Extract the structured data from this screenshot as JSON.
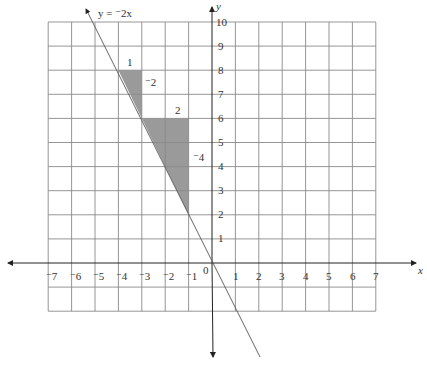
{
  "diagram": {
    "type": "coordinate-plane",
    "equation_label": "y = ⁻2x",
    "axis_labels": {
      "x": "x",
      "y": "y"
    },
    "x_ticks": [
      "⁻7",
      "⁻6",
      "⁻5",
      "⁻4",
      "⁻3",
      "⁻2",
      "⁻1",
      "1",
      "2",
      "3",
      "4",
      "5",
      "6",
      "7"
    ],
    "y_ticks": [
      "1",
      "2",
      "3",
      "4",
      "5",
      "6",
      "7",
      "8",
      "9",
      "10"
    ],
    "origin_label": "0",
    "x_range": [
      -7,
      7
    ],
    "y_range": [
      -2,
      10
    ],
    "line": {
      "slope": -2,
      "intercept": 0
    },
    "slope_triangles": [
      {
        "vertices": [
          [
            -4,
            8
          ],
          [
            -3,
            8
          ],
          [
            -3,
            6
          ]
        ],
        "run_label": "1",
        "rise_label": "⁻2"
      },
      {
        "vertices": [
          [
            -3,
            6
          ],
          [
            -1,
            6
          ],
          [
            -1,
            2
          ]
        ],
        "run_label": "2",
        "rise_label": "⁻4"
      }
    ],
    "colors": {
      "shade": "#9a9a9a",
      "grid": "#8a8a8a",
      "axis": "#222222"
    }
  }
}
